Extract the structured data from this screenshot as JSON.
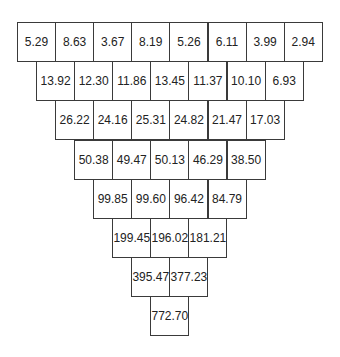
{
  "diagram": {
    "type": "number-pyramid",
    "rows": [
      [
        "5.29",
        "8.63",
        "3.67",
        "8.19",
        "5.26",
        "6.11",
        "3.99",
        "2.94"
      ],
      [
        "13.92",
        "12.30",
        "11.86",
        "13.45",
        "11.37",
        "10.10",
        "6.93"
      ],
      [
        "26.22",
        "24.16",
        "25.31",
        "24.82",
        "21.47",
        "17.03"
      ],
      [
        "50.38",
        "49.47",
        "50.13",
        "46.29",
        "38.50"
      ],
      [
        "99.85",
        "99.60",
        "96.42",
        "84.79"
      ],
      [
        "199.45",
        "196.02",
        "181.21"
      ],
      [
        "395.47",
        "377.23"
      ],
      [
        "772.70"
      ]
    ]
  }
}
